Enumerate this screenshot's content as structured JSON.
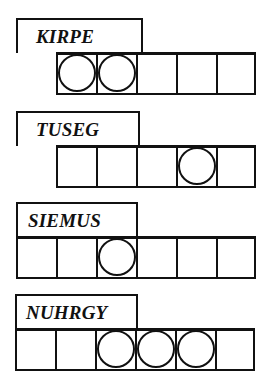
{
  "puzzle": {
    "type": "word-jumble",
    "jumbles": [
      {
        "scrambled": "KIRPE",
        "letter_count": 5,
        "circled_positions": [
          1,
          2
        ],
        "cells": [
          {
            "index": 1,
            "circled": true,
            "letter": ""
          },
          {
            "index": 2,
            "circled": true,
            "letter": ""
          },
          {
            "index": 3,
            "circled": false,
            "letter": ""
          },
          {
            "index": 4,
            "circled": false,
            "letter": ""
          },
          {
            "index": 5,
            "circled": false,
            "letter": ""
          }
        ]
      },
      {
        "scrambled": "TUSEG",
        "letter_count": 5,
        "circled_positions": [
          4
        ],
        "cells": [
          {
            "index": 1,
            "circled": false,
            "letter": ""
          },
          {
            "index": 2,
            "circled": false,
            "letter": ""
          },
          {
            "index": 3,
            "circled": false,
            "letter": ""
          },
          {
            "index": 4,
            "circled": true,
            "letter": ""
          },
          {
            "index": 5,
            "circled": false,
            "letter": ""
          }
        ]
      },
      {
        "scrambled": "SIEMUS",
        "letter_count": 6,
        "circled_positions": [
          3
        ],
        "cells": [
          {
            "index": 1,
            "circled": false,
            "letter": ""
          },
          {
            "index": 2,
            "circled": false,
            "letter": ""
          },
          {
            "index": 3,
            "circled": true,
            "letter": ""
          },
          {
            "index": 4,
            "circled": false,
            "letter": ""
          },
          {
            "index": 5,
            "circled": false,
            "letter": ""
          },
          {
            "index": 6,
            "circled": false,
            "letter": ""
          }
        ]
      },
      {
        "scrambled": "NUHRGY",
        "letter_count": 6,
        "circled_positions": [
          3,
          4,
          5
        ],
        "cells": [
          {
            "index": 1,
            "circled": false,
            "letter": ""
          },
          {
            "index": 2,
            "circled": false,
            "letter": ""
          },
          {
            "index": 3,
            "circled": true,
            "letter": ""
          },
          {
            "index": 4,
            "circled": true,
            "letter": ""
          },
          {
            "index": 5,
            "circled": true,
            "letter": ""
          },
          {
            "index": 6,
            "circled": false,
            "letter": ""
          }
        ]
      }
    ]
  }
}
